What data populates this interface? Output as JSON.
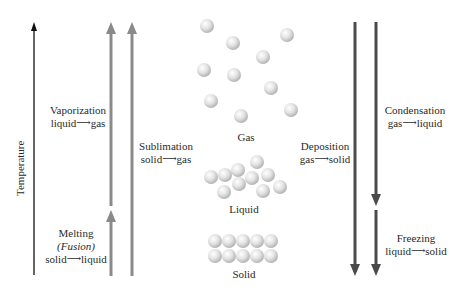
{
  "axis": {
    "label": "Temperature"
  },
  "phases": {
    "gas": "Gas",
    "liquid": "Liquid",
    "solid": "Solid"
  },
  "transitions": {
    "vaporization": {
      "name": "Vaporization",
      "from": "liquid",
      "to": "gas"
    },
    "melting": {
      "name": "Melting",
      "alt": "(Fusion)",
      "from": "solid",
      "to": "liquid"
    },
    "sublimation": {
      "name": "Sublimation",
      "from": "solid",
      "to": "gas"
    },
    "deposition": {
      "name": "Deposition",
      "from": "gas",
      "to": "solid"
    },
    "condensation": {
      "name": "Condensation",
      "from": "gas",
      "to": "liquid"
    },
    "freezing": {
      "name": "Freezing",
      "from": "liquid",
      "to": "solid"
    }
  },
  "arrow_glyph": "⟶",
  "colors": {
    "endothermic": "#8a8a8a",
    "exothermic": "#4a4a4a",
    "axis": "#111111",
    "particle": "#dcdcdc"
  }
}
